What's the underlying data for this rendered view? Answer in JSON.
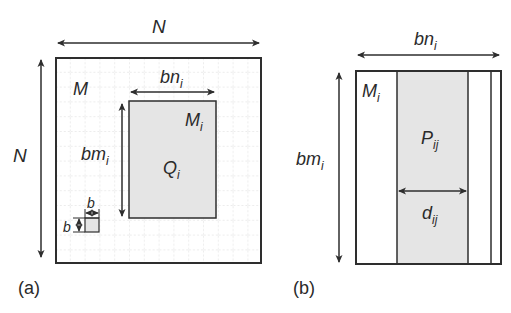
{
  "panel_a": {
    "caption": "(a)",
    "width_label": "N",
    "height_label": "N",
    "matrix_label": "M",
    "submatrix": {
      "label": "M",
      "label_sub": "i",
      "region_label": "Q",
      "region_sub": "i",
      "width_label": "bn",
      "width_sub": "i",
      "height_label": "bm",
      "height_sub": "i"
    },
    "block": {
      "width_label": "b",
      "height_label": "b"
    }
  },
  "panel_b": {
    "caption": "(b)",
    "width_label": "bn",
    "width_sub": "i",
    "height_label": "bm",
    "height_sub": "i",
    "matrix_label": "M",
    "matrix_sub": "i",
    "panel_label": "P",
    "panel_sub": "ij",
    "panel_width_label": "d",
    "panel_width_sub": "ij"
  },
  "colors": {
    "stroke": "#2e2e2e",
    "fill_shaded": "#e6e6e6",
    "grid": "#c8c8c8"
  }
}
